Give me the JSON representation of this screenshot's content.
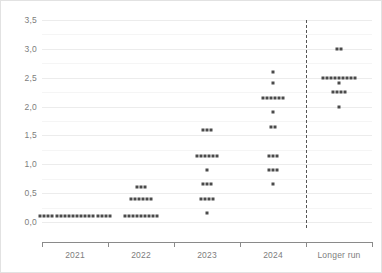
{
  "chart_data": {
    "type": "scatter",
    "title": "",
    "subtitle": "",
    "xlabel": "",
    "ylabel": "",
    "categories": [
      "2021",
      "2022",
      "2023",
      "2024",
      "Longer run"
    ],
    "ylim": [
      0.0,
      3.5
    ],
    "ytick_values": [
      0.0,
      0.5,
      1.0,
      1.5,
      2.0,
      2.5,
      3.0,
      3.5
    ],
    "ytick_labels": [
      "0,0",
      "0,5",
      "1,0",
      "1,5",
      "2,0",
      "2,5",
      "3,0",
      "3,5"
    ],
    "y_minor_gridlines": [
      0.25,
      0.75,
      1.25,
      1.75,
      2.25,
      2.75,
      3.25
    ],
    "grid": true,
    "legend": null,
    "decimal_separator": ",",
    "marker": "square",
    "marker_color": "#4a4a4a",
    "gridline_color": "#ececec",
    "axis_color": "#8a8a8a",
    "label_color": "#7d7d7d",
    "background_color": "#ffffff",
    "border_color": "#e2e2e2",
    "annotations": [
      {
        "name": "longer-run-divider",
        "type": "vertical-dashed-line",
        "between_categories": [
          "2024",
          "Longer run"
        ],
        "color": "#555555"
      }
    ],
    "series": [
      {
        "name": "2021",
        "category": "2021",
        "rows": [
          {
            "value": 0.1,
            "count": 18
          }
        ]
      },
      {
        "name": "2022",
        "category": "2022",
        "rows": [
          {
            "value": 0.6,
            "count": 3
          },
          {
            "value": 0.4,
            "count": 6
          },
          {
            "value": 0.1,
            "count": 9
          }
        ]
      },
      {
        "name": "2023",
        "category": "2023",
        "rows": [
          {
            "value": 1.6,
            "count": 3
          },
          {
            "value": 1.15,
            "count": 6
          },
          {
            "value": 0.9,
            "count": 1
          },
          {
            "value": 0.65,
            "count": 3
          },
          {
            "value": 0.4,
            "count": 4
          },
          {
            "value": 0.15,
            "count": 1
          }
        ]
      },
      {
        "name": "2024",
        "category": "2024",
        "rows": [
          {
            "value": 2.6,
            "count": 1
          },
          {
            "value": 2.4,
            "count": 1
          },
          {
            "value": 2.15,
            "count": 6
          },
          {
            "value": 1.9,
            "count": 1
          },
          {
            "value": 1.65,
            "count": 2
          },
          {
            "value": 1.15,
            "count": 3
          },
          {
            "value": 0.9,
            "count": 3
          },
          {
            "value": 0.65,
            "count": 1
          }
        ]
      },
      {
        "name": "Longer run",
        "category": "Longer run",
        "rows": [
          {
            "value": 3.0,
            "count": 2
          },
          {
            "value": 2.5,
            "count": 9
          },
          {
            "value": 2.4,
            "count": 1
          },
          {
            "value": 2.25,
            "count": 4
          },
          {
            "value": 2.0,
            "count": 1
          }
        ]
      }
    ]
  }
}
